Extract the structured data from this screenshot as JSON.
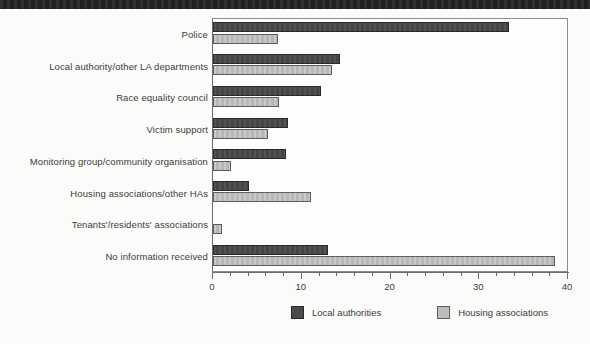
{
  "chart_data": {
    "type": "bar",
    "orientation": "horizontal",
    "title": "",
    "xlabel": "",
    "ylabel": "",
    "xlim": [
      0,
      40
    ],
    "x_major_ticks": [
      0,
      10,
      20,
      30,
      40
    ],
    "x_major_tick_labels": [
      "0",
      "10",
      "20",
      "30",
      "40"
    ],
    "x_minor_tick_step": 2,
    "grid": false,
    "legend_position": "bottom",
    "categories": [
      "Police",
      "Local authority/other LA departments",
      "Race equality council",
      "Victim support",
      "Monitoring group/community organisation",
      "Housing associations/other HAs",
      "Tenants'/residents' associations",
      "No information received"
    ],
    "series": [
      {
        "name": "Local authorities",
        "color": "#4a4a4a",
        "values": [
          33.4,
          14.3,
          12.2,
          8.4,
          8.2,
          4.1,
          0,
          13.0
        ]
      },
      {
        "name": "Housing associations",
        "color": "#bdbdbb",
        "values": [
          7.3,
          13.4,
          7.4,
          6.2,
          2.0,
          11.0,
          1.0,
          38.5
        ]
      }
    ]
  },
  "legend": {
    "items": [
      {
        "label": "Local authorities",
        "swatch": "dark-gray-swatch"
      },
      {
        "label": "Housing associations",
        "swatch": "light-gray-swatch"
      }
    ]
  }
}
